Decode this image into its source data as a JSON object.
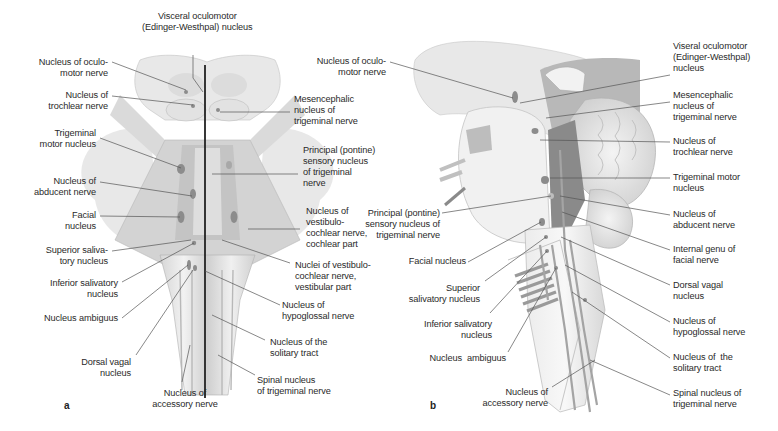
{
  "figure": {
    "panel_a": {
      "letter": "a",
      "view": "dorsal view of brainstem with midline",
      "labels": {
        "visceral_oculomotor": "Visceral oculomotor\n(Edinger-Westhpal) nucleus",
        "oculomotor": "Nucleus of oculo-\nmotor nerve",
        "trochlear": "Nucleus of\ntrochlear nerve",
        "trigeminal_motor": "Trigeminal\nmotor nucleus",
        "abducent": "Nucleus of\nabducent nerve",
        "facial": "Facial\nnucleus",
        "superior_salivatory": "Superior saliva-\ntory nucleus",
        "inferior_salivatory": "Inferior salivatory\nnucleus",
        "ambiguus": "Nucleus ambiguus",
        "dorsal_vagal": "Dorsal vagal\nnucleus",
        "accessory": "Nucleus of\naccessory nerve",
        "mesencephalic": "Mesencephalic\nnucleus of\ntrigeminal nerve",
        "principal_sensory": "Principal (pontine)\nsensory nucleus\nof trigeminal\nnerve",
        "vestibulocochlear_cochlear": "Nucleus of\nvestibulo-\ncochlear nerve,\ncochlear part",
        "vestibulocochlear_vestibular": "Nuclei of vestibulo-\ncochlear nerve,\nvestibular part",
        "hypoglossal": "Nucleus of\nhypoglossal nerve",
        "solitary_tract": "Nucleus of the\nsolitary tract",
        "spinal_trigeminal": "Spinal nucleus\nof trigeminal nerve"
      }
    },
    "panel_b": {
      "letter": "b",
      "view": "midsagittal view of brainstem",
      "labels": {
        "oculomotor": "Nucleus of oculo-\nmotor nerve",
        "principal_sensory": "Principal (pontine)\nsensory nucleus of\ntrigeminal nerve",
        "facial": "Facial nucleus",
        "superior_salivatory": "Superior\nsalivatory nucleus",
        "inferior_salivatory": "Inferior salivatory\nnucleus",
        "ambiguus": "Nucleus  ambiguus",
        "accessory": "Nucleus of\naccessory nerve",
        "visceral_oculomotor": "Viseral oculomotor\n(Edinger-Westhpal)\nnucleus",
        "mesencephalic": "Mesencephalic\nnucleus of\ntrigeminal nerve",
        "trochlear": "Nucleus of\ntrochlear nerve",
        "trigeminal_motor": "Trigeminal motor\nnucleus",
        "abducent": "Nucleus of\nabducent nerve",
        "internal_genu": "Internal genu of\nfacial nerve",
        "dorsal_vagal": "Dorsal vagal\nnucleus",
        "hypoglossal": "Nucleus of\nhypoglossal nerve",
        "solitary_tract": "Nucleus of  the\nsolitary tract",
        "spinal_trigeminal": "Spinal nucleus of\ntrigeminal nerve"
      }
    },
    "colors": {
      "background": "#ffffff",
      "tissue_light": "#e6e6e6",
      "tissue_mid": "#c8c8c8",
      "tissue_dark": "#9a9a9a",
      "nucleus_fill": "#8c8c8c",
      "leader_line": "#555555",
      "midline": "#222222",
      "text": "#2a2a2a"
    }
  }
}
